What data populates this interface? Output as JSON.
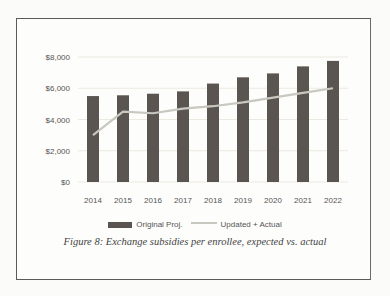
{
  "chart_data": {
    "type": "bar",
    "title": "",
    "caption": "Figure 8: Exchange subsidies per enrollee, expected vs. actual",
    "xlabel": "",
    "ylabel": "",
    "categories": [
      "2014",
      "2015",
      "2016",
      "2017",
      "2018",
      "2019",
      "2020",
      "2021",
      "2022"
    ],
    "series": [
      {
        "name": "Original Proj.",
        "type": "bar",
        "color": "#5a5550",
        "values": [
          5500,
          5550,
          5650,
          5800,
          6300,
          6700,
          6950,
          7400,
          7750
        ]
      },
      {
        "name": "Updated + Actual",
        "type": "line",
        "color": "#c8c8c0",
        "values": [
          3000,
          4500,
          4400,
          4700,
          4850,
          5100,
          5400,
          5700,
          6000
        ]
      }
    ],
    "yticks": [
      "$0",
      "$2,000",
      "$4,000",
      "$6,000",
      "$8,000"
    ],
    "ylim": [
      0,
      8000
    ],
    "grid": true,
    "legend_position": "bottom"
  },
  "legend": {
    "bar_label": "Original Proj.",
    "line_label": "Updated + Actual"
  },
  "caption": "Figure 8: Exchange subsidies per enrollee, expected vs. actual"
}
